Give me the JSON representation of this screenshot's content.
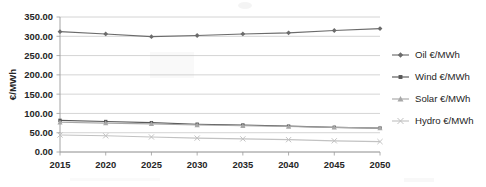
{
  "chart_data": {
    "type": "line",
    "title": "",
    "xlabel": "",
    "ylabel": "€/MWh",
    "x": [
      2015,
      2020,
      2025,
      2030,
      2035,
      2040,
      2045,
      2050
    ],
    "categories": [
      "2015",
      "2020",
      "2025",
      "2030",
      "2035",
      "2040",
      "2045",
      "2050"
    ],
    "ylim": [
      0,
      350
    ],
    "ytick_labels": [
      "0.00",
      "50.00",
      "100.00",
      "150.00",
      "200.00",
      "250.00",
      "300.00",
      "350.00"
    ],
    "ytick_values": [
      0,
      50,
      100,
      150,
      200,
      250,
      300,
      350
    ],
    "grid": true,
    "legend_position": "right",
    "series": [
      {
        "name": "Oil €/MWh",
        "values": [
          312,
          306,
          299,
          302,
          306,
          309,
          315,
          320
        ],
        "color": "#6b6b6b",
        "marker": "diamond"
      },
      {
        "name": "Wind €/MWh",
        "values": [
          82,
          79,
          76,
          72,
          70,
          67,
          64,
          62
        ],
        "color": "#585858",
        "marker": "square"
      },
      {
        "name": "Solar €/MWh",
        "values": [
          77,
          75,
          73,
          70,
          68,
          66,
          64,
          62
        ],
        "color": "#a8a8a8",
        "marker": "triangle"
      },
      {
        "name": "Hydro €/MWh",
        "values": [
          44,
          42,
          39,
          36,
          34,
          32,
          29,
          27
        ],
        "color": "#c2c2c2",
        "marker": "cross"
      }
    ]
  }
}
